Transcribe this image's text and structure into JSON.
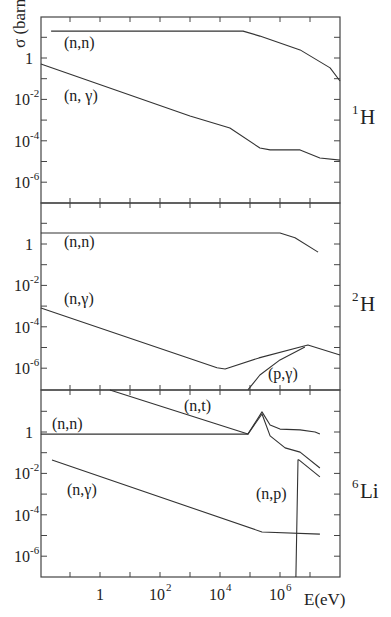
{
  "figure": {
    "ylabel": "σ (barn)",
    "xlabel": "E(eV)",
    "x_ticks": [
      {
        "logE": 0,
        "label": "1"
      },
      {
        "logE": 2,
        "label": "10",
        "sup": "2"
      },
      {
        "logE": 4,
        "label": "10",
        "sup": "4"
      },
      {
        "logE": 6,
        "label": "10",
        "sup": "6"
      }
    ],
    "y_ticks": [
      {
        "logS": 0,
        "label": "1",
        "sup": ""
      },
      {
        "logS": -2,
        "label": "10",
        "sup": "-2"
      },
      {
        "logS": -4,
        "label": "10",
        "sup": "-4"
      },
      {
        "logS": -6,
        "label": "10",
        "sup": "-6"
      }
    ]
  },
  "chart_data": [
    {
      "type": "line",
      "title": "1H",
      "panel_label": {
        "sup": "1",
        "base": "H"
      },
      "xscale": "log",
      "yscale": "log",
      "xlabel": "E(eV)",
      "ylabel": "σ (barn)",
      "xlim_log10": [
        -2,
        8
      ],
      "ylim_log10": [
        -7.9,
        2
      ],
      "series": [
        {
          "name": "(n,n)",
          "label_pos": [
            -1.2,
            0.5
          ],
          "points_log10": [
            [
              -1.63,
              1.3
            ],
            [
              4.77,
              1.3
            ],
            [
              5.33,
              1.06
            ],
            [
              6.67,
              0.39
            ],
            [
              7.67,
              -0.48
            ],
            [
              8,
              -1.11
            ]
          ]
        },
        {
          "name": "(n, γ)",
          "label_pos": [
            -1.2,
            -2.1
          ],
          "points_log10": [
            [
              -1.97,
              -0.29
            ],
            [
              3,
              -2.8
            ],
            [
              4.33,
              -3.38
            ],
            [
              5.33,
              -4.35
            ],
            [
              5.67,
              -4.44
            ],
            [
              6.67,
              -4.44
            ],
            [
              7.33,
              -4.83
            ],
            [
              8,
              -4.93
            ]
          ]
        }
      ]
    },
    {
      "type": "line",
      "title": "2H",
      "panel_label": {
        "sup": "2",
        "base": "H"
      },
      "xscale": "log",
      "yscale": "log",
      "xlim_log10": [
        -2,
        8
      ],
      "ylim_log10": [
        -7.0,
        2
      ],
      "series": [
        {
          "name": "(n,n)",
          "label_pos": [
            -1.2,
            -0.15
          ],
          "points_log10": [
            [
              -1.97,
              0.53
            ],
            [
              6,
              0.53
            ],
            [
              6.5,
              0.3
            ],
            [
              7.27,
              -0.39
            ]
          ]
        },
        {
          "name": "(n,γ)",
          "label_pos": [
            -1.2,
            -2.9
          ],
          "points_log10": [
            [
              -1.97,
              -3.09
            ],
            [
              3.9,
              -5.98
            ],
            [
              4.17,
              -6.04
            ],
            [
              5.3,
              -5.5
            ],
            [
              6.93,
              -4.88
            ],
            [
              8,
              -5.36
            ]
          ]
        },
        {
          "name": "(p,γ)",
          "label_pos": [
            5.6,
            -6.5
          ],
          "points_log10": [
            [
              4.93,
              -7.05
            ],
            [
              5.33,
              -6.33
            ],
            [
              6,
              -5.6
            ],
            [
              6.83,
              -4.97
            ]
          ]
        }
      ]
    },
    {
      "type": "line",
      "title": "6Li",
      "panel_label": {
        "sup": "6",
        "base": "Li"
      },
      "xscale": "log",
      "yscale": "log",
      "xlim_log10": [
        -2,
        8
      ],
      "ylim_log10": [
        -7.0,
        2
      ],
      "series": [
        {
          "name": "(n,n)",
          "label_pos": [
            -1.6,
            0.15
          ],
          "points_log10": [
            [
              -1.97,
              -0.1
            ],
            [
              4.93,
              -0.1
            ],
            [
              5.4,
              0.97
            ],
            [
              5.67,
              0.34
            ],
            [
              6,
              0.14
            ],
            [
              6.67,
              0.1
            ],
            [
              7.17,
              0.0
            ],
            [
              7.33,
              -0.1
            ]
          ]
        },
        {
          "name": "(n,t)",
          "label_pos": [
            2.8,
            1.0
          ],
          "points_log10": [
            [
              0.33,
              2.03
            ],
            [
              4.93,
              -0.1
            ],
            [
              5.4,
              0.87
            ],
            [
              5.67,
              -0.19
            ],
            [
              6.17,
              -0.77
            ],
            [
              6.67,
              -0.97
            ],
            [
              7.33,
              -1.74
            ]
          ]
        },
        {
          "name": "(n,p)",
          "label_pos": [
            5.2,
            -3.25
          ],
          "points_log10": [
            [
              6.53,
              -7.0
            ],
            [
              6.6,
              -1.35
            ],
            [
              6.63,
              -1.35
            ],
            [
              7.33,
              -2.17
            ]
          ]
        },
        {
          "name": "(n,γ)",
          "label_pos": [
            -1.1,
            -3.05
          ],
          "points_log10": [
            [
              -1.6,
              -1.35
            ],
            [
              5.4,
              -4.83
            ],
            [
              7.33,
              -4.93
            ]
          ]
        }
      ]
    }
  ]
}
